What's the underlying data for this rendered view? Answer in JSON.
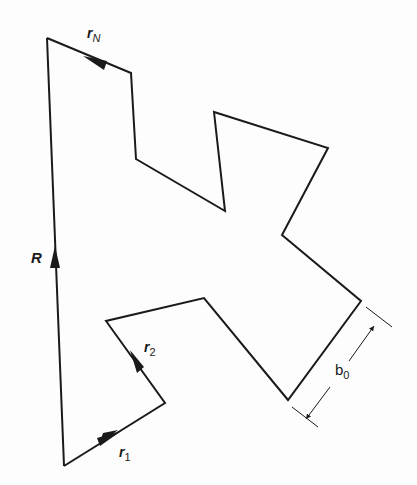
{
  "diagram": {
    "type": "freely-jointed chain (random walk polymer)",
    "labels": {
      "end_to_end": "R",
      "first_bond": "r",
      "first_bond_sub": "1",
      "second_bond": "r",
      "second_bond_sub": "2",
      "last_bond": "r",
      "last_bond_sub": "N",
      "bond_length": "b",
      "bond_length_sub": "0"
    },
    "chain_vertices": [
      [
        64,
        466
      ],
      [
        165,
        403
      ],
      [
        106,
        321
      ],
      [
        204,
        298
      ],
      [
        288,
        400
      ],
      [
        361,
        301
      ],
      [
        282,
        235
      ],
      [
        328,
        148
      ],
      [
        214,
        112
      ],
      [
        225,
        211
      ],
      [
        136,
        159
      ],
      [
        131,
        73
      ],
      [
        47,
        38
      ]
    ],
    "colors": {
      "line": "#1a1a1a",
      "background": "#fdfdfd"
    }
  }
}
